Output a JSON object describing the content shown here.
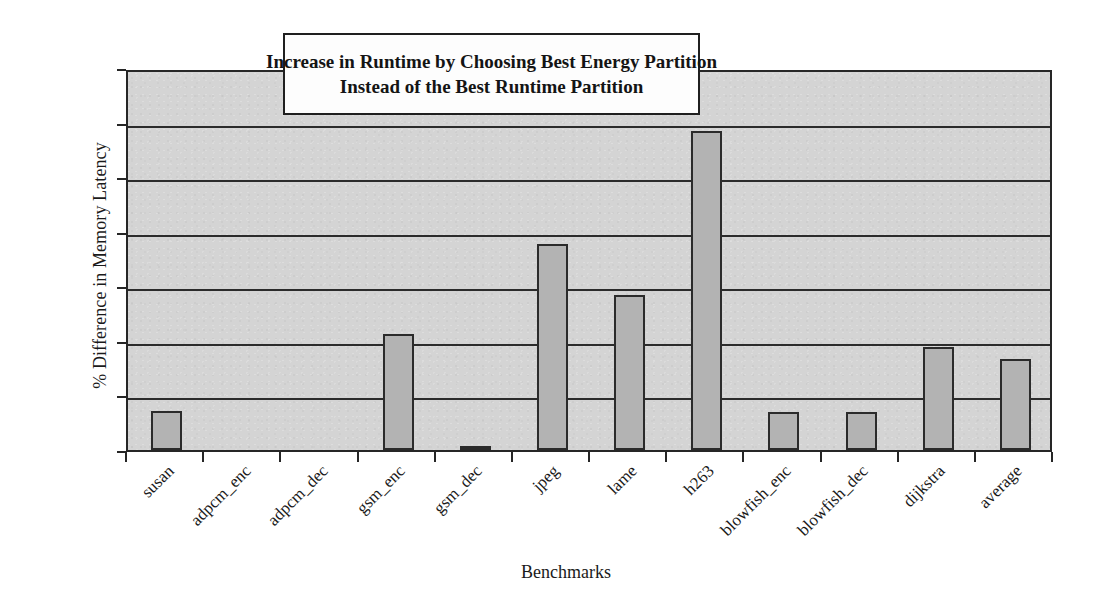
{
  "chart_data": {
    "type": "bar",
    "title": "Increase in Runtime by Choosing Best Energy Partition Instead of the Best Runtime Partition",
    "title_lines": [
      "Increase in Runtime by Choosing Best Energy Partition",
      "Instead of the Best Runtime Partition"
    ],
    "xlabel": "Benchmarks",
    "ylabel": "% Difference in Memory Latency",
    "categories": [
      "susan",
      "adpcm_enc",
      "adpcm_dec",
      "gsm_enc",
      "gsm_dec",
      "jpeg",
      "lame",
      "h263",
      "blowfish_enc",
      "blowfish_dec",
      "dijkstra",
      "average"
    ],
    "values": [
      0.72,
      0.0,
      0.0,
      2.12,
      0.07,
      3.78,
      2.84,
      5.84,
      0.7,
      0.7,
      1.89,
      1.67
    ],
    "ylim": [
      0,
      7
    ],
    "ytick_values": [
      0,
      1,
      2,
      3,
      4,
      5,
      6,
      7
    ],
    "ytick_labels": [
      "0%",
      "1%",
      "2%",
      "3%",
      "4%",
      "5%",
      "6%",
      "7%"
    ],
    "grid": true,
    "legend": false,
    "series_name": "% Difference in Memory Latency",
    "colors": {
      "bar_fill": "#b3b3b3",
      "bar_border": "#2b2b2b",
      "plot_background": "#d4d4d4",
      "axis": "#262626",
      "text": "#1a1a1a",
      "title_box_background": "#fdfdfd",
      "figure_background": "#ffffff"
    }
  }
}
